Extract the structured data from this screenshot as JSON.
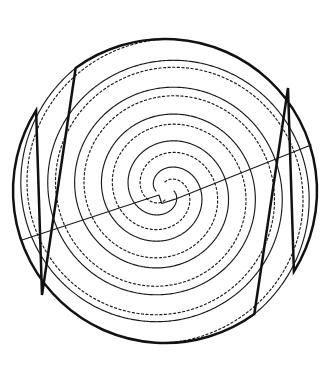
{
  "figure": {
    "type": "line-art",
    "width": 334,
    "height": 384,
    "background_color": "#ffffff",
    "ink_color": "#1a1a1a",
    "boundary_color": "#111111"
  },
  "geometry": {
    "center": {
      "x": 165,
      "y": 191
    },
    "outer_radius": 152,
    "inner_start_radius": 9,
    "turns": 2.65,
    "arm_count": 4,
    "rotational_symmetry_deg": 180
  },
  "chart_data": {
    "type": "line",
    "xlabel": "",
    "ylabel": "",
    "grid": false,
    "legend": null,
    "center": {
      "x": 165,
      "y": 191
    },
    "spiral_model": "archimedean",
    "series": [
      {
        "name": "solid-arm-a",
        "style": "solid",
        "stroke": "#1a1a1a",
        "stroke_width": 1.15,
        "phase_deg": 0,
        "r0": 9,
        "r1": 152,
        "theta_start_deg": 0,
        "theta_end_deg": 954
      },
      {
        "name": "dotted-arm-a",
        "style": "dotted",
        "stroke": "#1a1a1a",
        "stroke_width": 1.15,
        "dash": "2.2 2.4",
        "phase_deg": 90,
        "r0": 9,
        "r1": 152,
        "theta_start_deg": 0,
        "theta_end_deg": 900
      },
      {
        "name": "solid-arm-b",
        "style": "solid",
        "stroke": "#1a1a1a",
        "stroke_width": 1.15,
        "phase_deg": 180,
        "r0": 9,
        "r1": 152,
        "theta_start_deg": 0,
        "theta_end_deg": 954
      },
      {
        "name": "dotted-arm-b",
        "style": "dotted",
        "stroke": "#1a1a1a",
        "stroke_width": 1.15,
        "dash": "2.2 2.4",
        "phase_deg": 270,
        "r0": 9,
        "r1": 152,
        "theta_start_deg": 0,
        "theta_end_deg": 900
      }
    ],
    "boundary": {
      "name": "outer-circle",
      "stroke": "#111111",
      "stroke_width": 2.5,
      "radius": 152,
      "notches": [
        {
          "name": "upper-right-notch",
          "angle_deg": 43,
          "vertex": {
            "x": 288,
            "y": 88
          }
        },
        {
          "name": "lower-left-notch",
          "angle_deg": 223,
          "vertex": {
            "x": 42,
            "y": 295
          }
        }
      ]
    },
    "chord": {
      "name": "diagonal-line",
      "stroke": "#1a1a1a",
      "stroke_width": 1.15,
      "start": {
        "x": 22,
        "y": 240
      },
      "end": {
        "x": 311,
        "y": 145
      },
      "angle_deg": -18.2
    }
  }
}
